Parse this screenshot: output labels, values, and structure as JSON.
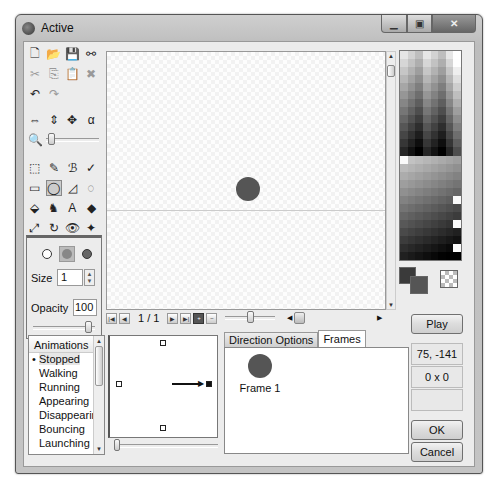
{
  "window": {
    "title": "Active",
    "controls": [
      "minimize",
      "maximize",
      "close"
    ]
  },
  "toolbar": {
    "rows": [
      [
        {
          "icon": "new-file-icon",
          "glyph": "🗋"
        },
        {
          "icon": "open-folder-icon",
          "glyph": "📂"
        },
        {
          "icon": "save-icon",
          "glyph": "💾"
        },
        {
          "icon": "link-icon",
          "glyph": "⚯"
        }
      ],
      [
        {
          "icon": "cut-icon",
          "glyph": "✂",
          "dim": true
        },
        {
          "icon": "copy-icon",
          "glyph": "⎘",
          "dim": true
        },
        {
          "icon": "paste-icon",
          "glyph": "📋"
        },
        {
          "icon": "delete-icon",
          "glyph": "✖",
          "dim": true
        }
      ],
      [
        {
          "icon": "undo-icon",
          "glyph": "↶"
        },
        {
          "icon": "redo-icon",
          "glyph": "↷",
          "dim": true
        }
      ],
      [
        {
          "icon": "flip-horizontal-icon",
          "glyph": "⇔"
        },
        {
          "icon": "flip-vertical-icon",
          "glyph": "⇕"
        },
        {
          "icon": "move-icon",
          "glyph": "✥"
        },
        {
          "icon": "alpha-icon",
          "glyph": "α"
        }
      ]
    ],
    "drawing_tools": [
      [
        {
          "icon": "selection-icon",
          "glyph": "⬚"
        },
        {
          "icon": "color-picker-icon",
          "glyph": "✎"
        },
        {
          "icon": "brush-icon",
          "glyph": "ℬ"
        },
        {
          "icon": "pencil-icon",
          "glyph": "✓"
        }
      ],
      [
        {
          "icon": "rectangle-icon",
          "glyph": "▭"
        },
        {
          "icon": "ellipse-icon",
          "glyph": "◯",
          "selected": true
        },
        {
          "icon": "polygon-icon",
          "glyph": "◿"
        },
        {
          "icon": "lasso-icon",
          "glyph": "◌"
        }
      ],
      [
        {
          "icon": "fill-icon",
          "glyph": "⬙"
        },
        {
          "icon": "clone-icon",
          "glyph": "♞"
        },
        {
          "icon": "text-icon",
          "glyph": "A"
        },
        {
          "icon": "eraser-icon",
          "glyph": "◆"
        }
      ],
      [
        {
          "icon": "resize-icon",
          "glyph": "⤢"
        },
        {
          "icon": "rotate-icon",
          "glyph": "↻"
        },
        {
          "icon": "eye-icon",
          "glyph": "👁"
        },
        {
          "icon": "hotspot-icon",
          "glyph": "✦"
        }
      ]
    ]
  },
  "brush": {
    "size_label": "Size",
    "size_value": "1",
    "opacity_label": "Opacity",
    "opacity_value": "100"
  },
  "frame_nav": {
    "counter": "1 / 1"
  },
  "right_panel": {
    "play_label": "Play",
    "coordinates": "75, -141",
    "dimensions": "0 x 0",
    "extra": "",
    "ok_label": "OK",
    "cancel_label": "Cancel"
  },
  "animations": {
    "header": "Animations",
    "items": [
      "Stopped",
      "Walking",
      "Running",
      "Appearing",
      "Disappearing",
      "Bouncing",
      "Launching"
    ],
    "selected": "Stopped"
  },
  "tabs": {
    "items": [
      "Direction Options",
      "Frames"
    ],
    "active": "Frames"
  },
  "frames": [
    {
      "label": "Frame 1"
    }
  ],
  "colors": {
    "sprite": "#555555",
    "primary": "#3a3a3a",
    "secondary": "#555555"
  }
}
